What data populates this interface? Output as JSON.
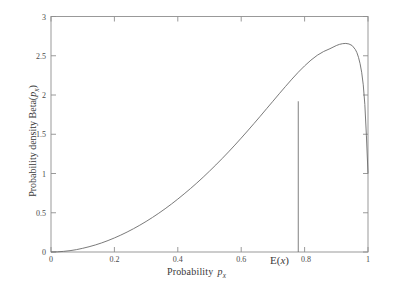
{
  "figure": {
    "background_color": "#ffffff",
    "axis_color": "#8a8a8a",
    "curve_color": "#6b6b6b",
    "text_color": "#3a3a3a"
  },
  "axes": {
    "x_title_prefix": "Probability",
    "x_title_var": "p",
    "x_title_sub": "x",
    "y_title_prefix": "Probability density Beta(",
    "y_title_var": "p",
    "y_title_sub": "x",
    "y_title_suffix": ")",
    "x_ticks": [
      "0",
      "0.2",
      "0.4",
      "0.6",
      "0.8",
      "1"
    ],
    "y_ticks": [
      "0",
      "0.5",
      "1",
      "1.5",
      "2",
      "2.5",
      "3"
    ]
  },
  "annotation": {
    "label_e": "E(",
    "label_var": "x",
    "label_close": ")"
  },
  "chart_data": {
    "type": "line",
    "title": "",
    "xlabel": "Probability p_x",
    "ylabel": "Probability density Beta( p_x )",
    "xlim": [
      0,
      1
    ],
    "ylim": [
      0,
      3
    ],
    "xticks": [
      0,
      0.2,
      0.4,
      0.6,
      0.8,
      1
    ],
    "yticks": [
      0,
      0.5,
      1,
      1.5,
      2,
      2.5,
      3
    ],
    "grid": false,
    "legend": "none",
    "series": [
      {
        "name": "Beta probability density",
        "x": [
          0.0,
          0.02,
          0.04,
          0.06,
          0.08,
          0.1,
          0.12,
          0.14,
          0.16,
          0.18,
          0.2,
          0.22,
          0.24,
          0.26,
          0.28,
          0.3,
          0.32,
          0.34,
          0.36,
          0.38,
          0.4,
          0.42,
          0.44,
          0.46,
          0.48,
          0.5,
          0.52,
          0.54,
          0.56,
          0.58,
          0.6,
          0.62,
          0.64,
          0.66,
          0.68,
          0.7,
          0.72,
          0.74,
          0.76,
          0.78,
          0.8,
          0.82,
          0.84,
          0.86,
          0.88,
          0.9,
          0.91,
          0.92,
          0.93,
          0.94,
          0.95,
          0.96,
          0.965,
          0.97,
          0.975,
          0.98,
          0.985,
          0.99,
          0.995,
          1.0
        ],
        "y": [
          0.0,
          0.002,
          0.008,
          0.017,
          0.03,
          0.047,
          0.067,
          0.09,
          0.116,
          0.146,
          0.179,
          0.215,
          0.254,
          0.296,
          0.341,
          0.389,
          0.44,
          0.494,
          0.551,
          0.611,
          0.674,
          0.74,
          0.808,
          0.879,
          0.953,
          1.03,
          1.109,
          1.191,
          1.275,
          1.362,
          1.451,
          1.542,
          1.635,
          1.729,
          1.825,
          1.92,
          2.016,
          2.11,
          2.202,
          2.29,
          2.371,
          2.444,
          2.506,
          2.554,
          2.59,
          2.63,
          2.645,
          2.654,
          2.657,
          2.65,
          2.63,
          2.58,
          2.54,
          2.48,
          2.4,
          2.29,
          2.13,
          1.88,
          1.48,
          1.0
        ]
      }
    ],
    "annotations": [
      {
        "type": "vertical-line",
        "label": "E(x)",
        "x": 0.78,
        "y_top": 1.92,
        "y_bottom": 0
      }
    ]
  }
}
